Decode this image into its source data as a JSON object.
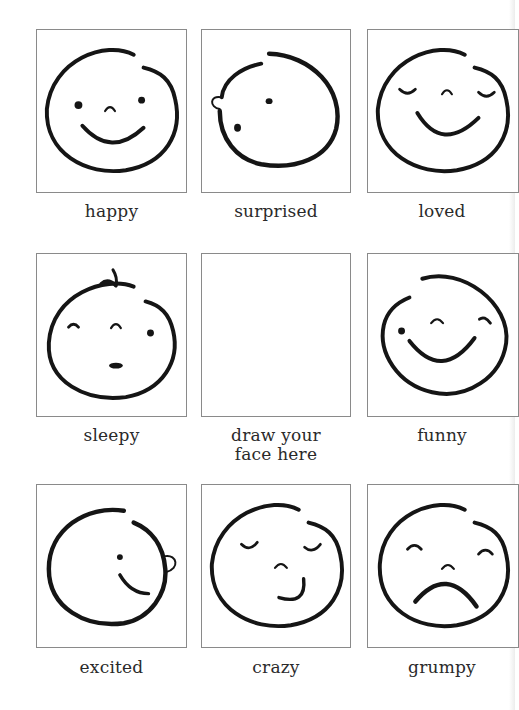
{
  "worksheet": {
    "cells": [
      {
        "label": "happy",
        "face": "happy"
      },
      {
        "label": "surprised",
        "face": "surprised"
      },
      {
        "label": "loved",
        "face": "loved"
      },
      {
        "label": "sleepy",
        "face": "sleepy"
      },
      {
        "label": "draw your face here",
        "label_line1": "draw your",
        "label_line2": "face here",
        "face": "blank"
      },
      {
        "label": "funny",
        "face": "funny"
      },
      {
        "label": "excited",
        "face": "excited"
      },
      {
        "label": "crazy",
        "face": "crazy"
      },
      {
        "label": "grumpy",
        "face": "grumpy"
      }
    ]
  },
  "colors": {
    "ink": "#151515",
    "box_border": "#8a8a8a",
    "label_text": "#2a2a2a",
    "background": "#ffffff"
  }
}
